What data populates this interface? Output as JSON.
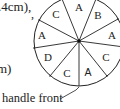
{
  "text_fragments": {
    "top_line": ".4cm),",
    "top_comma": ",",
    "mid_line": "m)",
    "handle_label": "handle front"
  },
  "wheel": {
    "center": [
      79,
      41
    ],
    "radius": 45,
    "stroke_color": "#222222",
    "segments": [
      {
        "label": "C",
        "pos": [
          56,
          14
        ]
      },
      {
        "label": "A",
        "pos": [
          79,
          7
        ]
      },
      {
        "label": "B",
        "pos": [
          98,
          15
        ]
      },
      {
        "label": "A",
        "pos": [
          112,
          35
        ]
      },
      {
        "label": "C",
        "pos": [
          106,
          57
        ]
      },
      {
        "label": "A",
        "pos": [
          88,
          72
        ],
        "font": "sans"
      },
      {
        "label": "C",
        "pos": [
          67,
          73
        ]
      },
      {
        "label": "D",
        "pos": [
          48,
          57
        ]
      },
      {
        "label": "A",
        "pos": [
          42,
          35
        ]
      }
    ]
  }
}
